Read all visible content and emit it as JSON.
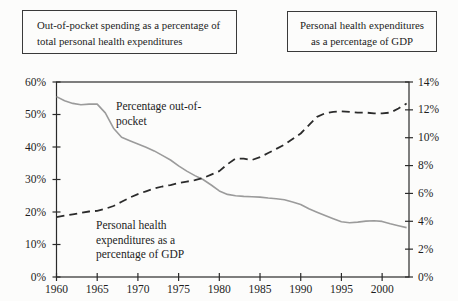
{
  "colors": {
    "axis": "#2a2a2a",
    "text": "#1d1d1d",
    "background": "#fcfcfb",
    "solid_series": "#9b9b9b",
    "dashed_series": "#2b2b2b"
  },
  "chart_data": {
    "type": "line",
    "title": "",
    "legend_boxes": {
      "left": {
        "line1": "Out-of-pocket spending as a percentage of",
        "line2": "total personal health expenditures"
      },
      "right": {
        "line1": "Personal health expenditures",
        "line2": "as a percentage of GDP"
      }
    },
    "x": {
      "start_year": 1960,
      "end_year": 2003,
      "axis_right_edge_year": 2003.3,
      "tick_years": [
        1960,
        1965,
        1970,
        1975,
        1980,
        1985,
        1990,
        1995,
        2000
      ]
    },
    "left_axis": {
      "min": 0,
      "max": 60,
      "tick_step": 10,
      "tick_labels": [
        "0%",
        "10%",
        "20%",
        "30%",
        "40%",
        "50%",
        "60%"
      ]
    },
    "right_axis": {
      "min": 0,
      "max": 14,
      "tick_step": 2,
      "tick_labels": [
        "0%",
        "2%",
        "4%",
        "6%",
        "8%",
        "10%",
        "12%",
        "14%"
      ]
    },
    "series": [
      {
        "name": "Percentage out-of-pocket",
        "axis": "left",
        "style": "solid",
        "color": "#9b9b9b",
        "values": [
          55.5,
          54.2,
          53.4,
          53.0,
          53.2,
          53.2,
          50.5,
          45.8,
          43.0,
          41.9,
          40.9,
          39.9,
          38.8,
          37.4,
          36.0,
          34.2,
          32.6,
          31.2,
          30.0,
          28.3,
          26.5,
          25.4,
          25.0,
          24.8,
          24.7,
          24.6,
          24.3,
          24.1,
          23.8,
          23.1,
          22.3,
          21.0,
          19.9,
          18.9,
          17.9,
          17.0,
          16.7,
          16.9,
          17.2,
          17.3,
          17.1,
          16.4,
          15.8,
          15.2
        ]
      },
      {
        "name": "Personal health expenditures as a percentage of GDP",
        "axis": "right",
        "style": "dashed",
        "color": "#2b2b2b",
        "values": [
          4.3,
          4.4,
          4.5,
          4.6,
          4.7,
          4.75,
          4.9,
          5.1,
          5.4,
          5.7,
          5.95,
          6.15,
          6.35,
          6.5,
          6.6,
          6.75,
          6.85,
          6.95,
          7.1,
          7.35,
          7.6,
          8.1,
          8.5,
          8.5,
          8.4,
          8.6,
          8.9,
          9.2,
          9.5,
          9.9,
          10.3,
          10.9,
          11.5,
          11.75,
          11.85,
          11.9,
          11.85,
          11.8,
          11.8,
          11.75,
          11.75,
          11.8,
          12.1,
          12.45
        ]
      }
    ],
    "annotations": [
      {
        "target": "out-of-pocket-series",
        "lines": [
          "Percentage out-of-",
          "pocket"
        ]
      },
      {
        "target": "gdp-series",
        "lines": [
          "Personal health",
          "expenditures as a",
          "percentage of  GDP"
        ]
      }
    ]
  }
}
